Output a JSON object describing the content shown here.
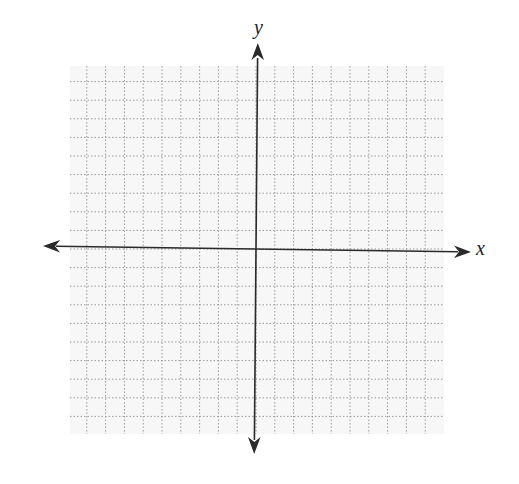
{
  "diagram": {
    "type": "coordinate-plane",
    "x_axis_label": "x",
    "y_axis_label": "y",
    "grid": {
      "columns": 20,
      "rows": 20,
      "line_style": "dotted",
      "line_color": "#9a9a9a",
      "background": "#f7f7f7"
    },
    "axis_color": "#2a2a2a",
    "arrows": [
      "left",
      "right",
      "up",
      "down"
    ]
  }
}
